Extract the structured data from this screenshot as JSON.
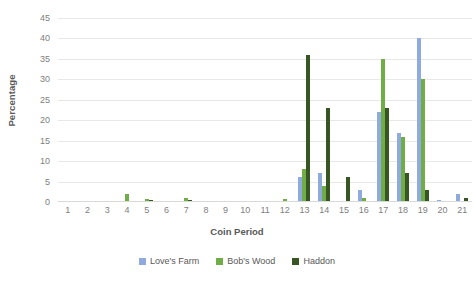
{
  "chart_data": {
    "type": "bar",
    "title": "",
    "xlabel": "Coin Period",
    "ylabel": "Percentage",
    "ylim": [
      0,
      45
    ],
    "ytick_step": 5,
    "yticks": [
      45,
      40,
      35,
      30,
      25,
      20,
      15,
      10,
      5,
      0
    ],
    "grid": true,
    "legend_position": "bottom",
    "categories": [
      "1",
      "2",
      "3",
      "4",
      "5",
      "6",
      "7",
      "8",
      "9",
      "10",
      "11",
      "12",
      "13",
      "14",
      "15",
      "16",
      "17",
      "18",
      "19",
      "20",
      "21"
    ],
    "series": [
      {
        "name": "Love's Farm",
        "color": "#8FAADC",
        "values": [
          0,
          0,
          0,
          0,
          0,
          0,
          0,
          0,
          0,
          0,
          0,
          0,
          6,
          7,
          0,
          3,
          22,
          17,
          40,
          0.4,
          2
        ]
      },
      {
        "name": "Bob's Wood",
        "color": "#70AD47",
        "values": [
          0,
          0,
          0,
          2,
          0.7,
          0,
          1,
          0,
          0,
          0,
          0,
          0.8,
          8,
          4,
          0,
          1,
          35,
          16,
          30,
          0,
          0
        ]
      },
      {
        "name": "Haddon",
        "color": "#375623",
        "values": [
          0,
          0.3,
          0,
          0,
          0.4,
          0,
          0.5,
          0,
          0,
          0.3,
          0.3,
          0,
          36,
          23,
          6,
          0,
          23,
          7,
          3,
          0,
          1
        ]
      }
    ]
  },
  "axes": {
    "y_title": "Percentage",
    "x_title": "Coin Period"
  },
  "legend": {
    "items": [
      {
        "label": "Love's Farm",
        "color": "#8FAADC"
      },
      {
        "label": "Bob's Wood",
        "color": "#70AD47"
      },
      {
        "label": "Haddon",
        "color": "#375623"
      }
    ]
  },
  "colors": {
    "loves_farm": "#8FAADC",
    "bobs_wood": "#70AD47",
    "haddon": "#375623",
    "gridline": "#E8E8E8",
    "tick_text": "#808080",
    "title_text": "#595959",
    "background": "#FFFFFF"
  }
}
